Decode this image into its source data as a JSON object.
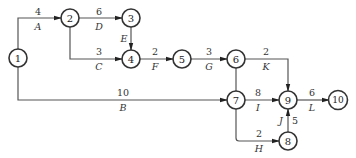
{
  "diagram": {
    "type": "activity-on-arrow network",
    "nodes": [
      {
        "id": "1",
        "x": 18,
        "y": 58
      },
      {
        "id": "2",
        "x": 70,
        "y": 18
      },
      {
        "id": "3",
        "x": 131,
        "y": 18
      },
      {
        "id": "4",
        "x": 131,
        "y": 59
      },
      {
        "id": "5",
        "x": 182,
        "y": 59
      },
      {
        "id": "6",
        "x": 236,
        "y": 59
      },
      {
        "id": "7",
        "x": 236,
        "y": 100
      },
      {
        "id": "8",
        "x": 288,
        "y": 141
      },
      {
        "id": "9",
        "x": 288,
        "y": 100
      },
      {
        "id": "10",
        "x": 338,
        "y": 100
      }
    ],
    "activities": [
      {
        "name": "A",
        "duration": "4",
        "from": "1",
        "to": "2"
      },
      {
        "name": "B",
        "duration": "10",
        "from": "1",
        "to": "7"
      },
      {
        "name": "C",
        "duration": "3",
        "from": "2",
        "to": "4"
      },
      {
        "name": "D",
        "duration": "6",
        "from": "2",
        "to": "3"
      },
      {
        "name": "E",
        "duration": "",
        "from": "3",
        "to": "4"
      },
      {
        "name": "F",
        "duration": "2",
        "from": "4",
        "to": "5"
      },
      {
        "name": "G",
        "duration": "3",
        "from": "5",
        "to": "6"
      },
      {
        "name": "K",
        "duration": "2",
        "from": "6",
        "to": "9"
      },
      {
        "name": "I",
        "duration": "8",
        "from": "7",
        "to": "9"
      },
      {
        "name": "H",
        "duration": "2",
        "from": "7",
        "to": "8"
      },
      {
        "name": "J",
        "duration": "5",
        "from": "8",
        "to": "9"
      },
      {
        "name": "L",
        "duration": "6",
        "from": "9",
        "to": "10"
      }
    ],
    "dummy": {
      "from": "6",
      "to": "7"
    }
  }
}
